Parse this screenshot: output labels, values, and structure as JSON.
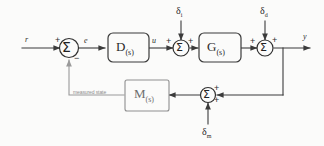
{
  "diagram": {
    "type": "block-diagram",
    "background_color": "#fbfbfa",
    "line_color": "#3b3b3b",
    "feedback_line_color": "#9a9a9a",
    "signals": {
      "reference": "r",
      "error": "e",
      "control": "u",
      "output": "y"
    },
    "disturbances": {
      "input_disturbance": "δ",
      "input_disturbance_sub": "i",
      "output_disturbance": "δ",
      "output_disturbance_sub": "d",
      "measurement_noise": "δ",
      "measurement_noise_sub": "m"
    },
    "blocks": [
      {
        "id": "controller",
        "label": "D",
        "sublabel": "(s)"
      },
      {
        "id": "plant",
        "label": "G",
        "sublabel": "(s)"
      },
      {
        "id": "sensor",
        "label": "M",
        "sublabel": "(s)"
      }
    ],
    "summing_junctions": [
      {
        "id": "error-junction",
        "glyph": "Σ",
        "signs": [
          "+",
          "−"
        ]
      },
      {
        "id": "input-disturbance-junction",
        "glyph": "Σ",
        "signs": [
          "+",
          "+"
        ]
      },
      {
        "id": "output-disturbance-junction",
        "glyph": "Σ",
        "signs": [
          "+",
          "+"
        ]
      },
      {
        "id": "measurement-junction",
        "glyph": "Σ",
        "signs": [
          "+",
          "+"
        ]
      }
    ],
    "annotations": {
      "feedback_path": "measured state"
    },
    "signs": {
      "plus": "+",
      "minus": "−"
    }
  }
}
